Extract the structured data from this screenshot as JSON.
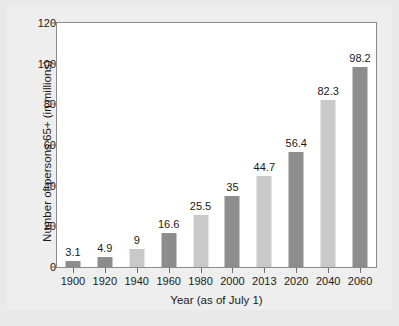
{
  "chart_data": {
    "type": "bar",
    "title": "",
    "xlabel": "Year (as of July 1)",
    "ylabel": "Number of persons 65+ (in millions)",
    "categories": [
      "1900",
      "1920",
      "1940",
      "1960",
      "1980",
      "2000",
      "2013",
      "2020",
      "2040",
      "2060"
    ],
    "values": [
      3.1,
      4.9,
      9,
      16.6,
      25.5,
      35,
      44.7,
      56.4,
      82.3,
      98.2
    ],
    "value_labels": [
      "3.1",
      "4.9",
      "9",
      "16.6",
      "25.5",
      "35",
      "44.7",
      "56.4",
      "82.3",
      "98.2"
    ],
    "bar_shades": [
      "dark",
      "dark",
      "light",
      "dark",
      "light",
      "dark",
      "light",
      "dark",
      "light",
      "dark"
    ],
    "ylim": [
      0,
      120
    ],
    "yticks": [
      0,
      20,
      40,
      60,
      80,
      100,
      120
    ],
    "ytick_labels": [
      "0",
      "20",
      "40",
      "60",
      "80",
      "100",
      "120"
    ],
    "grid": false,
    "legend": "none",
    "colors": {
      "bar_dark": "#8d8d8d",
      "bar_light": "#c9c9c9",
      "figure_background": "#e9e9e9",
      "plot_background": "#ffffff",
      "frame": "#8a8a8a",
      "text": "#1a1a1a"
    }
  }
}
